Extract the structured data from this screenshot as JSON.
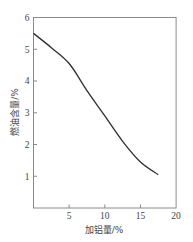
{
  "chart_data": {
    "type": "line",
    "title": "",
    "xlabel": "加铝量/%",
    "ylabel": "燃油含量/%",
    "xlim": [
      0,
      20
    ],
    "ylim": [
      0,
      6
    ],
    "xticks": [
      5,
      10,
      15,
      20
    ],
    "yticks": [
      1,
      2,
      3,
      4,
      5,
      6
    ],
    "grid": false,
    "legend": null,
    "series": [
      {
        "name": "燃油含量",
        "x": [
          0,
          2.5,
          5,
          7.5,
          10,
          12.5,
          15,
          17.5
        ],
        "y": [
          5.5,
          5.05,
          4.55,
          3.7,
          2.9,
          2.1,
          1.45,
          1.05
        ]
      }
    ],
    "colors": {
      "curve": "#2e2e2e",
      "axes": "#8a8a8a",
      "text": "#444444"
    }
  }
}
